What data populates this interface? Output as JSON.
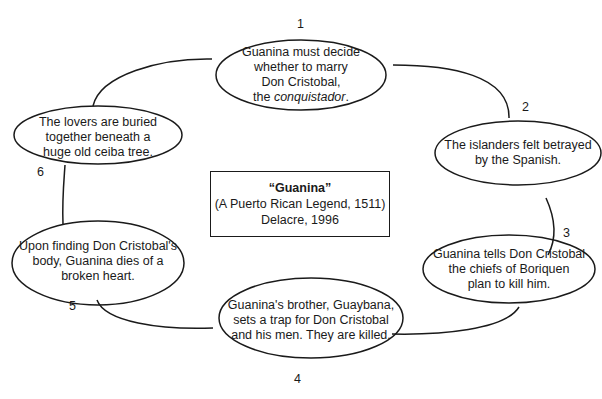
{
  "diagram": {
    "type": "cycle",
    "center": {
      "title": "“Guanina”",
      "subtitle": "(A Puerto Rican Legend, 1511)",
      "author_line": "Delacre, 1996"
    },
    "events": [
      {
        "number": "1",
        "lines": [
          "Guanina must decide",
          "whether to marry",
          "Don Cristobal,"
        ],
        "line4_prefix": "the ",
        "line4_italic": "conquistador",
        "line4_suffix": "."
      },
      {
        "number": "2",
        "lines": [
          "The islanders felt betrayed",
          "by the Spanish."
        ]
      },
      {
        "number": "3",
        "lines": [
          "Guanina tells Don Cristobal",
          "the chiefs of Boriquen",
          "plan to kill him."
        ]
      },
      {
        "number": "4",
        "lines": [
          "Guanina's brother, Guaybana,",
          "sets a trap for Don Cristobal",
          "and his men. They are killed."
        ]
      },
      {
        "number": "5",
        "lines": [
          "Upon finding Don Cristobal's",
          "body, Guanina dies of a",
          "broken heart."
        ]
      },
      {
        "number": "6",
        "lines": [
          "The lovers are buried",
          "together beneath a",
          "huge old ceiba tree."
        ]
      }
    ],
    "colors": {
      "line": "#1a1a1a",
      "background": "#ffffff"
    }
  }
}
